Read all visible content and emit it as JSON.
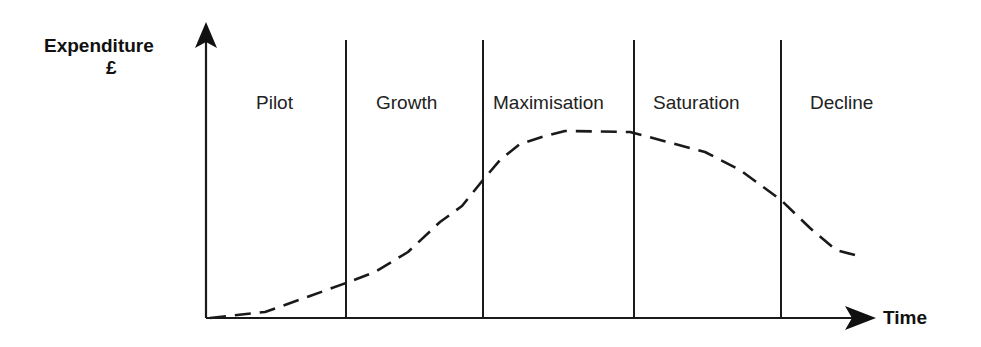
{
  "diagram": {
    "type": "product-lifecycle",
    "y_axis": {
      "label_line1": "Expenditure",
      "label_line2": "£"
    },
    "x_axis": {
      "label": "Time"
    },
    "stages": [
      {
        "label": "Pilot"
      },
      {
        "label": "Growth"
      },
      {
        "label": "Maximisation"
      },
      {
        "label": "Saturation"
      },
      {
        "label": "Decline"
      }
    ],
    "curve": {
      "style": "dashed",
      "description": "Expenditure rises slowly, grows, peaks during Maximisation, plateaus into Saturation, then declines"
    },
    "colors": {
      "line": "#1a1a1a",
      "background": "#ffffff"
    }
  }
}
